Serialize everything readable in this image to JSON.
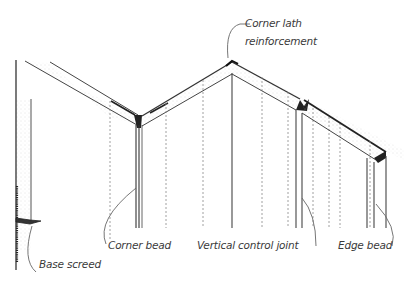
{
  "diagram": {
    "colors": {
      "line": "#444444",
      "dashed": "#8a8a8a",
      "text": "#3a3a3a",
      "stipple": "#c8c8c8"
    },
    "labels": {
      "corner_lath": {
        "line1": "Corner lath",
        "line2": "reinforcement"
      },
      "corner_bead": "Corner bead",
      "control_joint": "Vertical control joint",
      "edge_bead": "Edge bead",
      "base_screed": "Base screed"
    }
  }
}
